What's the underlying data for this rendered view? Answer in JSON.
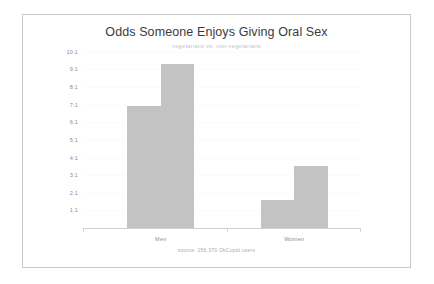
{
  "chart_data": {
    "type": "bar",
    "title": "Odds Someone Enjoys Giving Oral Sex",
    "subtitle": "vegetarians vs. non-vegetarians",
    "source": "source: 256,370 OkCupid users",
    "xlabel": "",
    "ylabel": "",
    "categories": [
      "Men",
      "Women"
    ],
    "ylim": [
      0,
      10.5
    ],
    "grid": true,
    "legend": "none",
    "bar_color": "#c3c3c3",
    "yticks": [
      {
        "label": "10:1",
        "value": 10
      },
      {
        "label": "9:1",
        "value": 9
      },
      {
        "label": "8:1",
        "value": 8
      },
      {
        "label": "7:1",
        "value": 7
      },
      {
        "label": "6:1",
        "value": 6
      },
      {
        "label": "5:1",
        "value": 5
      },
      {
        "label": "4:1",
        "value": 4
      },
      {
        "label": "3:1",
        "value": 3
      },
      {
        "label": "2:1",
        "value": 2
      },
      {
        "label": "1:1",
        "value": 1
      }
    ],
    "series": [
      {
        "name": "vegetarians",
        "values": [
          6.9,
          1.6
        ]
      },
      {
        "name": "non-vegetarians",
        "values": [
          9.3,
          3.5
        ]
      }
    ],
    "bars": [
      {
        "category": "Men",
        "series": "vegetarians",
        "value": 6.9
      },
      {
        "category": "Men",
        "series": "non-vegetarians",
        "value": 9.3
      },
      {
        "category": "Women",
        "series": "vegetarians",
        "value": 1.6
      },
      {
        "category": "Women",
        "series": "non-vegetarians",
        "value": 3.5
      }
    ]
  }
}
